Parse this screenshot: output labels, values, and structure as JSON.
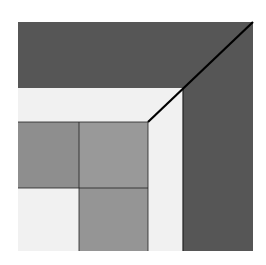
{
  "figure": {
    "colors": {
      "background": "#ffffff",
      "dark_band": "#565656",
      "light_band": "#f1f1f1",
      "grey_left": "#8e8e8e",
      "grey_mid": "#999999",
      "grey_bottom": "#959595",
      "line": "#000000"
    }
  }
}
